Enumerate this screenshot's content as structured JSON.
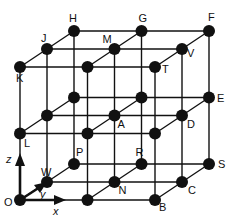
{
  "diagram": {
    "type": "3x3x3 cubic lattice",
    "grid": {
      "origin": [
        20,
        200
      ],
      "dx": [
        67.5,
        0
      ],
      "dy": [
        27,
        -18
      ],
      "dz": [
        0,
        -66.5
      ]
    },
    "axes": [
      {
        "name": "x",
        "label": "x"
      },
      {
        "name": "y",
        "label": "y"
      },
      {
        "name": "z",
        "label": "z"
      }
    ],
    "labeled_points": [
      {
        "label": "O",
        "i": 0,
        "j": 0,
        "k": 0
      },
      {
        "label": "B",
        "i": 2,
        "j": 0,
        "k": 0
      },
      {
        "label": "W",
        "i": 0,
        "j": 1,
        "k": 0
      },
      {
        "label": "N",
        "i": 1,
        "j": 1,
        "k": 0
      },
      {
        "label": "C",
        "i": 2,
        "j": 1,
        "k": 0
      },
      {
        "label": "P",
        "i": 0,
        "j": 2,
        "k": 0.5
      },
      {
        "label": "R",
        "i": 1,
        "j": 2,
        "k": 0.5
      },
      {
        "label": "S",
        "i": 2,
        "j": 2,
        "k": 0
      },
      {
        "label": "L",
        "i": 0,
        "j": 0,
        "k": 1
      },
      {
        "label": "A",
        "i": 1,
        "j": 1,
        "k": 1
      },
      {
        "label": "D",
        "i": 2,
        "j": 1,
        "k": 1
      },
      {
        "label": "E",
        "i": 2,
        "j": 2,
        "k": 1
      },
      {
        "label": "K",
        "i": 0,
        "j": 0,
        "k": 2
      },
      {
        "label": "T",
        "i": 2,
        "j": 0,
        "k": 2
      },
      {
        "label": "J",
        "i": 0,
        "j": 1,
        "k": 2
      },
      {
        "label": "M",
        "i": 1,
        "j": 1,
        "k": 2
      },
      {
        "label": "V",
        "i": 2,
        "j": 1,
        "k": 2
      },
      {
        "label": "H",
        "i": 0,
        "j": 2,
        "k": 2
      },
      {
        "label": "G",
        "i": 1,
        "j": 2,
        "k": 2
      },
      {
        "label": "F",
        "i": 2,
        "j": 2,
        "k": 2
      }
    ]
  }
}
